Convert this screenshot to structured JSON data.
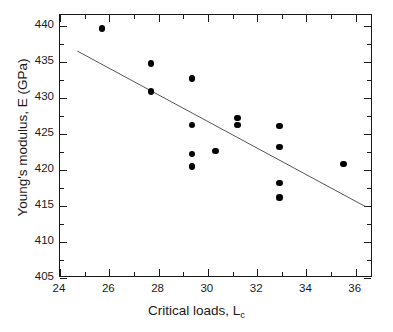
{
  "chart_data": {
    "type": "scatter",
    "title": "",
    "xlabel": "Critical loads, L_c",
    "xlabel_main": "Critical loads, L",
    "xlabel_sub": "c",
    "ylabel": "Young's modulus, E (GPa)",
    "xlim": [
      24,
      36.7
    ],
    "ylim": [
      405,
      441.5
    ],
    "xticks": [
      24,
      26,
      28,
      30,
      32,
      34,
      36
    ],
    "xtick_labels": [
      "24",
      "26",
      "28",
      "30",
      "32",
      "34",
      "36"
    ],
    "xminor_ticks": [
      25,
      27,
      29,
      31,
      33,
      35
    ],
    "yticks": [
      405,
      410,
      415,
      420,
      425,
      430,
      435,
      440
    ],
    "ytick_labels": [
      "405",
      "410",
      "415",
      "420",
      "425",
      "430",
      "435",
      "440"
    ],
    "yminor_ticks": [
      407.5,
      412.5,
      417.5,
      422.5,
      427.5,
      432.5,
      437.5
    ],
    "grid": false,
    "legend": null,
    "marker": "filled-circle",
    "marker_color": "#000000",
    "points": [
      {
        "x": 25.7,
        "y": 439.6
      },
      {
        "x": 27.7,
        "y": 434.8
      },
      {
        "x": 27.7,
        "y": 430.9
      },
      {
        "x": 29.35,
        "y": 432.7
      },
      {
        "x": 29.35,
        "y": 426.2
      },
      {
        "x": 29.35,
        "y": 422.2
      },
      {
        "x": 29.35,
        "y": 420.5
      },
      {
        "x": 30.3,
        "y": 422.6
      },
      {
        "x": 31.2,
        "y": 427.2
      },
      {
        "x": 31.2,
        "y": 426.2
      },
      {
        "x": 32.9,
        "y": 426.1
      },
      {
        "x": 32.9,
        "y": 423.2
      },
      {
        "x": 32.9,
        "y": 418.2
      },
      {
        "x": 32.9,
        "y": 416.2
      },
      {
        "x": 35.5,
        "y": 420.8
      }
    ],
    "fit_line": {
      "type": "linear-regression",
      "x_start": 24.7,
      "y_start": 436.5,
      "x_end": 36.4,
      "y_end": 414.9,
      "color": "#555555"
    }
  }
}
